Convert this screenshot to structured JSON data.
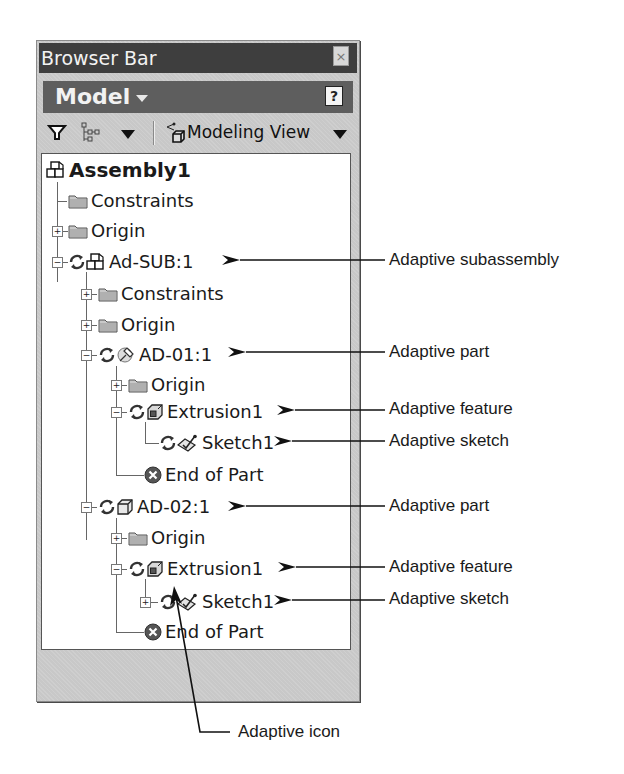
{
  "window": {
    "title": "Browser Bar",
    "close_glyph": "×"
  },
  "model_bar": {
    "label": "Model",
    "help_glyph": "?"
  },
  "toolbar": {
    "filter_icon": "filter-icon",
    "display_icon": "tree-display-icon",
    "view_label": "Modeling View"
  },
  "tree": {
    "items": [
      {
        "label": "Assembly1",
        "icon": "assembly-icon",
        "depth": 0,
        "expander": "none"
      },
      {
        "label": "Constraints",
        "icon": "folder-icon",
        "depth": 1,
        "expander": "none"
      },
      {
        "label": "Origin",
        "icon": "folder-icon",
        "depth": 1,
        "expander": "plus"
      },
      {
        "label": "Ad-SUB:1",
        "icon": "assembly-icon",
        "adaptive": true,
        "depth": 1,
        "expander": "minus"
      },
      {
        "label": "Constraints",
        "icon": "folder-icon",
        "depth": 2,
        "expander": "plus"
      },
      {
        "label": "Origin",
        "icon": "folder-icon",
        "depth": 2,
        "expander": "plus"
      },
      {
        "label": "AD-01:1",
        "icon": "part-pin-icon",
        "adaptive": true,
        "depth": 2,
        "expander": "minus"
      },
      {
        "label": "Origin",
        "icon": "folder-icon",
        "depth": 3,
        "expander": "plus"
      },
      {
        "label": "Extrusion1",
        "icon": "extrusion-icon",
        "adaptive": true,
        "depth": 3,
        "expander": "minus"
      },
      {
        "label": "Sketch1",
        "icon": "sketch-icon",
        "adaptive": true,
        "depth": 4,
        "expander": "none"
      },
      {
        "label": "End of Part",
        "icon": "end-of-part-icon",
        "depth": 3,
        "expander": "none"
      },
      {
        "label": "AD-02:1",
        "icon": "part-icon",
        "adaptive": true,
        "depth": 2,
        "expander": "minus"
      },
      {
        "label": "Origin",
        "icon": "folder-icon",
        "depth": 3,
        "expander": "plus"
      },
      {
        "label": "Extrusion1",
        "icon": "extrusion-icon",
        "adaptive": true,
        "depth": 3,
        "expander": "minus"
      },
      {
        "label": "Sketch1",
        "icon": "sketch-icon",
        "adaptive": true,
        "depth": 4,
        "expander": "plus"
      },
      {
        "label": "End of Part",
        "icon": "end-of-part-icon",
        "depth": 3,
        "expander": "none"
      }
    ]
  },
  "callouts": [
    {
      "label": "Adaptive subassembly",
      "target": "Ad-SUB:1"
    },
    {
      "label": "Adaptive part",
      "target": "AD-01:1"
    },
    {
      "label": "Adaptive feature",
      "target": "Extrusion1"
    },
    {
      "label": "Adaptive sketch",
      "target": "Sketch1"
    },
    {
      "label": "Adaptive part",
      "target": "AD-02:1"
    },
    {
      "label": "Adaptive feature",
      "target": "Extrusion1"
    },
    {
      "label": "Adaptive sketch",
      "target": "Sketch1"
    },
    {
      "label": "Adaptive icon",
      "target": "adaptive-icon"
    }
  ]
}
